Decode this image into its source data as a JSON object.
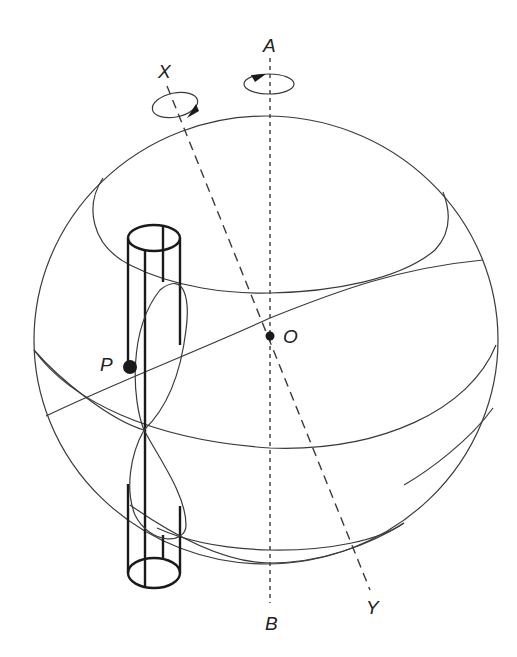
{
  "diagram": {
    "type": "3D sphere with rotation axes and cylinder",
    "labels": {
      "axis_a_top": "A",
      "axis_a_bottom": "B",
      "axis_x_top": "X",
      "axis_x_bottom": "Y",
      "center": "O",
      "point": "P"
    },
    "elements": [
      "sphere outline",
      "upper latitude circle",
      "equator circle",
      "lower latitude circle",
      "tilted great circle through O and P",
      "vertical axis AB (dotted)",
      "tilted axis XY (dashed)",
      "rotation arrow around axis A",
      "rotation arrow around axis X",
      "vertical cylinder through P",
      "figure-eight loop curve"
    ],
    "colors": {
      "stroke": "#3a3a3a",
      "background": "#ffffff"
    }
  }
}
